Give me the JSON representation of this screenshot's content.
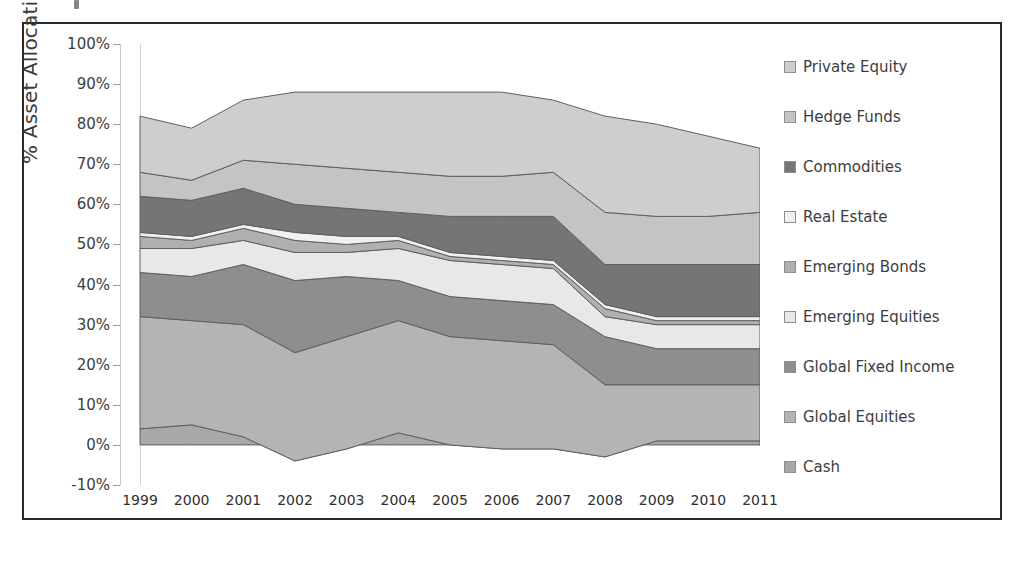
{
  "chart_data": {
    "type": "area",
    "stacked": true,
    "title": "",
    "xlabel": "",
    "ylabel": "% Asset Allocation",
    "categories": [
      "1999",
      "2000",
      "2001",
      "2002",
      "2003",
      "2004",
      "2005",
      "2006",
      "2007",
      "2008",
      "2009",
      "2010",
      "2011"
    ],
    "ylim": [
      -10,
      100
    ],
    "ytick_labels": [
      "100%",
      "90%",
      "80%",
      "70%",
      "60%",
      "50%",
      "40%",
      "30%",
      "20%",
      "10%",
      "0%",
      "-10%"
    ],
    "ytick_values": [
      100,
      90,
      80,
      70,
      60,
      50,
      40,
      30,
      20,
      10,
      0,
      -10
    ],
    "grid": false,
    "legend_position": "right",
    "series": [
      {
        "name": "Cash",
        "color": "#a8a8a8",
        "values": [
          4,
          5,
          2,
          -4,
          -1,
          3,
          0,
          -1,
          -1,
          -3,
          1,
          1,
          1
        ]
      },
      {
        "name": "Global Equities",
        "color": "#b4b4b4",
        "values": [
          28,
          26,
          28,
          27,
          28,
          28,
          27,
          27,
          26,
          18,
          14,
          14,
          14
        ]
      },
      {
        "name": "Global Fixed Income",
        "color": "#8e8e8e",
        "values": [
          11,
          11,
          15,
          18,
          15,
          10,
          10,
          10,
          10,
          12,
          9,
          9,
          9
        ]
      },
      {
        "name": "Emerging Equities",
        "color": "#e8e8e8",
        "values": [
          6,
          7,
          6,
          7,
          6,
          8,
          9,
          9,
          9,
          5,
          6,
          6,
          6
        ]
      },
      {
        "name": "Emerging Bonds",
        "color": "#b0b0b0",
        "values": [
          3,
          2,
          3,
          3,
          2,
          2,
          1,
          1,
          1,
          2,
          1,
          1,
          1
        ]
      },
      {
        "name": "Real Estate",
        "color": "#f0f0f0",
        "values": [
          1,
          1,
          1,
          2,
          2,
          1,
          1,
          1,
          1,
          1,
          1,
          1,
          1
        ]
      },
      {
        "name": "Commodities",
        "color": "#757575",
        "values": [
          9,
          9,
          9,
          7,
          7,
          6,
          9,
          10,
          11,
          10,
          13,
          13,
          13
        ]
      },
      {
        "name": "Hedge Funds",
        "color": "#c4c4c4",
        "values": [
          6,
          5,
          7,
          10,
          10,
          10,
          10,
          10,
          11,
          13,
          12,
          12,
          13
        ]
      },
      {
        "name": "Private Equity",
        "color": "#cecece",
        "values": [
          14,
          13,
          16,
          18,
          19,
          20,
          21,
          21,
          21,
          24,
          23,
          23,
          16
        ]
      }
    ],
    "cumulative_tops": {
      "Cash": [
        4,
        5,
        2,
        -4,
        -1,
        3,
        0,
        -1,
        -1,
        -3,
        1,
        1,
        1
      ],
      "Global Equities": [
        32,
        31,
        30,
        23,
        27,
        31,
        27,
        26,
        25,
        15,
        15,
        15,
        15
      ],
      "Global Fixed Income": [
        43,
        42,
        45,
        41,
        42,
        41,
        37,
        36,
        35,
        27,
        24,
        24,
        24
      ],
      "Emerging Equities": [
        49,
        49,
        51,
        48,
        48,
        49,
        46,
        45,
        44,
        32,
        30,
        30,
        30
      ],
      "Emerging Bonds": [
        52,
        51,
        54,
        51,
        50,
        51,
        47,
        46,
        45,
        34,
        31,
        31,
        31
      ],
      "Real Estate": [
        53,
        52,
        55,
        53,
        52,
        52,
        48,
        47,
        46,
        35,
        32,
        32,
        32
      ],
      "Commodities": [
        62,
        61,
        64,
        60,
        59,
        58,
        57,
        57,
        57,
        45,
        45,
        45,
        45
      ],
      "Hedge Funds": [
        68,
        66,
        71,
        70,
        69,
        68,
        67,
        67,
        68,
        58,
        57,
        57,
        58
      ],
      "Private Equity": [
        82,
        79,
        86,
        88,
        88,
        88,
        88,
        88,
        86,
        82,
        80,
        77,
        74
      ]
    },
    "legend_entries": [
      "Private Equity",
      "Hedge Funds",
      "Commodities",
      "Real Estate",
      "Emerging Bonds",
      "Emerging Equities",
      "Global Fixed Income",
      "Global Equities",
      "Cash"
    ]
  },
  "colors": {
    "border": "#2a2a2a",
    "axis": "#c8c8c8",
    "text": "#3d3d3d",
    "plot_top_fill": "#cecece"
  }
}
